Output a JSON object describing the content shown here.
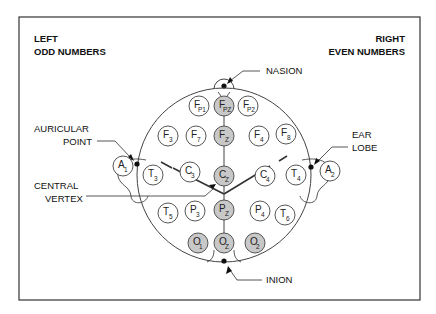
{
  "headings": {
    "left_line1": "LEFT",
    "left_line2": "ODD NUMBERS",
    "right_line1": "RIGHT",
    "right_line2": "EVEN NUMBERS"
  },
  "callouts": {
    "nasion": "NASION",
    "auricular_line1": "AURICULAR",
    "auricular_line2": "POINT",
    "ear_line1": "EAR",
    "ear_line2": "LOBE",
    "central_line1": "CENTRAL",
    "central_line2": "VERTEX",
    "inion": "INION"
  },
  "colors": {
    "midline_fill": "#c8c8c8",
    "lateral_fill": "#ffffff",
    "stroke": "#444444"
  },
  "electrodes": [
    {
      "id": "Fp1",
      "main": "F",
      "sub": "P1",
      "shaded": false
    },
    {
      "id": "Fpz",
      "main": "F",
      "sub": "PZ",
      "shaded": true
    },
    {
      "id": "Fp2",
      "main": "F",
      "sub": "P2",
      "shaded": false
    },
    {
      "id": "F3",
      "main": "F",
      "sub": "3",
      "shaded": false
    },
    {
      "id": "F7",
      "main": "F",
      "sub": "7",
      "shaded": false
    },
    {
      "id": "Fz",
      "main": "F",
      "sub": "Z",
      "shaded": true
    },
    {
      "id": "F4",
      "main": "F",
      "sub": "4",
      "shaded": false
    },
    {
      "id": "F8",
      "main": "F",
      "sub": "8",
      "shaded": false
    },
    {
      "id": "A1",
      "main": "A",
      "sub": "1",
      "shaded": false
    },
    {
      "id": "T3",
      "main": "T",
      "sub": "3",
      "shaded": false
    },
    {
      "id": "C3",
      "main": "C",
      "sub": "3",
      "shaded": false
    },
    {
      "id": "Cz",
      "main": "C",
      "sub": "Z",
      "shaded": true
    },
    {
      "id": "C4",
      "main": "C",
      "sub": "4",
      "shaded": false
    },
    {
      "id": "T4",
      "main": "T",
      "sub": "4",
      "shaded": false
    },
    {
      "id": "A2",
      "main": "A",
      "sub": "2",
      "shaded": false
    },
    {
      "id": "T5",
      "main": "T",
      "sub": "5",
      "shaded": false
    },
    {
      "id": "P3",
      "main": "P",
      "sub": "3",
      "shaded": false
    },
    {
      "id": "Pz",
      "main": "P",
      "sub": "Z",
      "shaded": true
    },
    {
      "id": "P4",
      "main": "P",
      "sub": "4",
      "shaded": false
    },
    {
      "id": "T6",
      "main": "T",
      "sub": "6",
      "shaded": false
    },
    {
      "id": "O1",
      "main": "O",
      "sub": "1",
      "shaded": true
    },
    {
      "id": "Oz",
      "main": "O",
      "sub": "Z",
      "shaded": true
    },
    {
      "id": "O2",
      "main": "O",
      "sub": "2",
      "shaded": true
    }
  ]
}
